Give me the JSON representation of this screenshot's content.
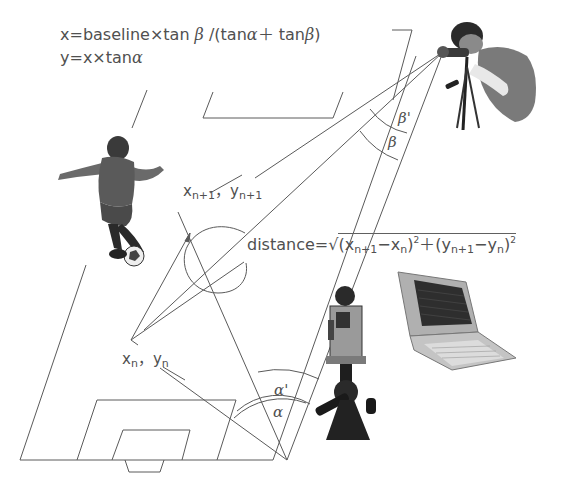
{
  "formulas": {
    "x_formula": {
      "prefix": "x=baseline×tan ",
      "beta": "β",
      "middle": " /(tan",
      "alpha": "α",
      "plus": "＋ tan",
      "beta2": "β",
      "suffix": ")"
    },
    "y_formula": {
      "prefix": "y=x×tan",
      "alpha": "α"
    },
    "distance": {
      "prefix": "distance=",
      "sqrt": "√",
      "t1": "(x",
      "s1": "n+1",
      "t2": "−x",
      "s2": "n",
      "t3": ")",
      "p1": "2",
      "t4": "＋(y",
      "s3": "n+1",
      "t5": "−y",
      "s4": "n",
      "t6": ")",
      "p2": "2"
    }
  },
  "points": {
    "next": {
      "x": "x",
      "x_sub": "n+1",
      "sep": "，",
      "y": "y",
      "y_sub": "n+1"
    },
    "current": {
      "x": "x",
      "x_sub": "n",
      "sep": "，",
      "y": "y",
      "y_sub": "n"
    }
  },
  "angles": {
    "alpha": "α",
    "alpha_prime": "α'",
    "beta": "β",
    "beta_prime": "β'"
  },
  "images": {
    "top_observer": "person-with-theodolite",
    "soccer_player": "soccer-player-kicking-ball",
    "bottom_camera": "camera-on-tripod",
    "laptop": "laptop-computer"
  },
  "colors": {
    "line": "#555555",
    "text": "#505050",
    "background": "#ffffff"
  }
}
